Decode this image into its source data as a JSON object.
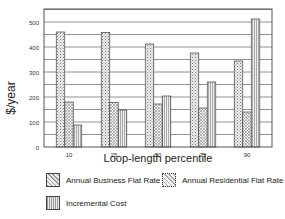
{
  "chart_data": {
    "type": "bar",
    "title": "",
    "xlabel": "Loop-length percentile",
    "ylabel": "$/year",
    "categories": [
      "10",
      "25",
      "50",
      "75",
      "90"
    ],
    "series": [
      {
        "name": "Annual Business Flat Rate",
        "values": [
          460,
          458,
          412,
          376,
          344
        ]
      },
      {
        "name": "Annual Residential Flat Rate",
        "values": [
          180,
          178,
          172,
          156,
          140
        ]
      },
      {
        "name": "Incremental  Cost",
        "values": [
          88,
          148,
          204,
          260,
          512
        ]
      }
    ],
    "ylim": [
      0,
      550
    ],
    "yticks": [
      0,
      100,
      200,
      300,
      400,
      500
    ],
    "grid": true,
    "legend_position": "bottom"
  },
  "legend": {
    "business": "Annual Business Flat Rate",
    "residential": "Annual Residential Flat Rate",
    "incremental": "Incremental  Cost"
  },
  "axes": {
    "ylabel": "$/year",
    "xlabel": "Loop-length percentile"
  }
}
